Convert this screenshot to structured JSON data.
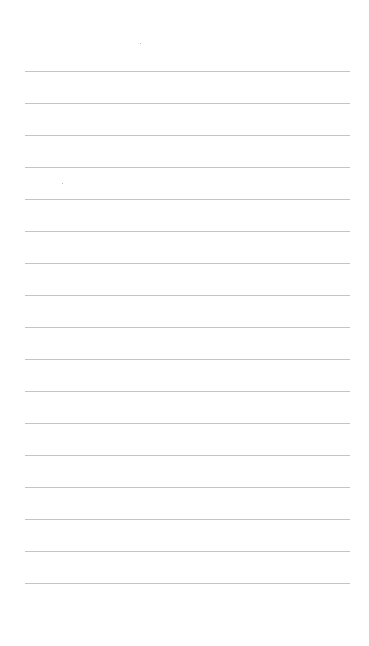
{
  "page": {
    "type": "blank lined paper",
    "line_count": 17,
    "first_line_y": 71,
    "line_spacing": 32,
    "line_left": 25,
    "line_width": 325,
    "line_color": "#c4c4c4",
    "background_color": "#ffffff"
  }
}
